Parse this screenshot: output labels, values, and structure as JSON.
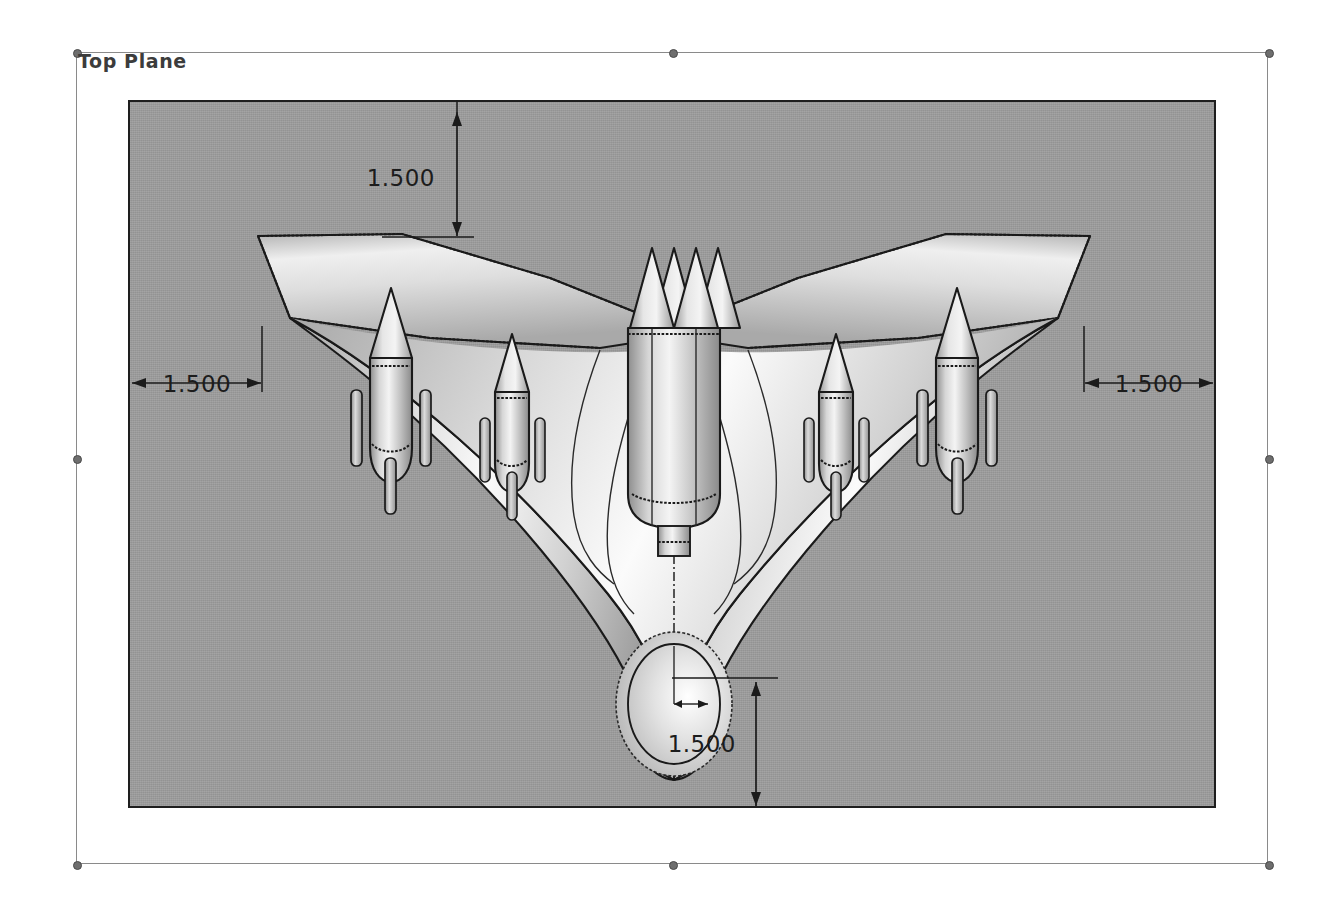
{
  "app": {
    "view_mode": "shaded-with-edges",
    "background_color": "#ffffff",
    "model_background_color": "#9c9c9c"
  },
  "plane": {
    "label": "Top Plane",
    "frame_name": "sketch-plane-selection-frame",
    "handles": [
      {
        "name": "handle-top-left"
      },
      {
        "name": "handle-top-center"
      },
      {
        "name": "handle-top-right"
      },
      {
        "name": "handle-middle-left"
      },
      {
        "name": "handle-middle-right"
      },
      {
        "name": "handle-bottom-left"
      },
      {
        "name": "handle-bottom-center"
      },
      {
        "name": "handle-bottom-right"
      }
    ]
  },
  "dimensions": [
    {
      "id": "dim-top",
      "value": "1.500",
      "orientation": "vertical",
      "position": "top"
    },
    {
      "id": "dim-left",
      "value": "1.500",
      "orientation": "horizontal",
      "position": "left"
    },
    {
      "id": "dim-right",
      "value": "1.500",
      "orientation": "horizontal",
      "position": "right"
    },
    {
      "id": "dim-bottom",
      "value": "1.500",
      "orientation": "vertical",
      "position": "bottom"
    }
  ],
  "model": {
    "name": "blended-wing-body-aircraft",
    "description": "Top view of a swept flying-wing aircraft with externally mounted missiles",
    "components": [
      {
        "name": "left-wing"
      },
      {
        "name": "right-wing"
      },
      {
        "name": "center-fuselage"
      },
      {
        "name": "nose-sensor-ellipse"
      },
      {
        "name": "twin-vertical-fins"
      }
    ],
    "missiles": [
      {
        "name": "missile-outer-left"
      },
      {
        "name": "missile-inner-left"
      },
      {
        "name": "missile-outer-right"
      },
      {
        "name": "missile-inner-right"
      }
    ]
  },
  "colors": {
    "edge": "#1a1a1a",
    "background_gray": "#9c9c9c",
    "surface_light": "#f2f2f2",
    "surface_mid": "#c8c8c8",
    "surface_dark": "#8f8f8f",
    "frame_line": "#8a8a8a",
    "handle": "#6e6e6e",
    "dimension_text": "#1c1c1c"
  }
}
